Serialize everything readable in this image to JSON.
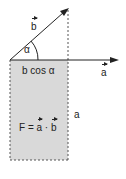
{
  "diagram": {
    "vector_a": {
      "name": "a",
      "is_vector": true
    },
    "vector_b": {
      "name": "b",
      "is_vector": true
    },
    "angle_label": "α",
    "projection_label": "b cos α",
    "side_label": "a",
    "formula": {
      "lhs": "F = ",
      "a": "a",
      "dot": " · ",
      "b": "b"
    },
    "colors": {
      "fill": "#d9d9d9",
      "line": "#222222",
      "dash": "#555555"
    }
  }
}
